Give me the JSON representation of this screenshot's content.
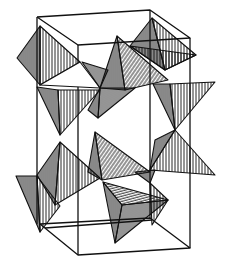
{
  "figure": {
    "title": "",
    "colors": {
      "line": "#111111",
      "background": "#ffffff"
    },
    "unit_cell": {
      "top": [
        [
          37,
          17
        ],
        [
          150,
          10
        ],
        [
          190,
          38
        ],
        [
          78,
          45
        ]
      ],
      "bottom": [
        [
          40,
          224
        ],
        [
          150,
          218
        ],
        [
          190,
          248
        ],
        [
          78,
          255
        ]
      ],
      "mid": [
        [
          37,
          87
        ],
        [
          150,
          82
        ],
        [
          190,
          108
        ],
        [
          78,
          114
        ]
      ]
    }
  }
}
